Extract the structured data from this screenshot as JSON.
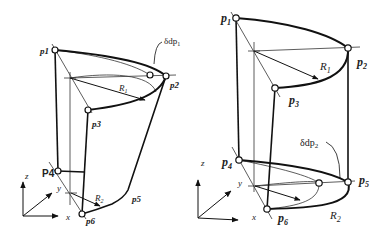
{
  "figures": [
    {
      "id": "left",
      "description": "Tapered (cone-like) sweep between two circular arcs of different radii",
      "points": {
        "p1": "p1",
        "p2": "p2",
        "p3": "p3",
        "p4": "P4",
        "p5": "p5",
        "p6": "p6"
      },
      "radii": {
        "R1": "R",
        "R1_sub": "1",
        "R2": "R",
        "R2_sub": "2"
      },
      "deviation_label": "δdp",
      "deviation_sub": "1",
      "axes": {
        "x": "x",
        "y": "y",
        "z": "z"
      }
    },
    {
      "id": "right",
      "description": "Cylinder-like sweep between two circular arcs",
      "points": {
        "p1": "p",
        "p1_sub": "1",
        "p2": "p",
        "p2_sub": "2",
        "p3": "p",
        "p3_sub": "3",
        "p4": "p",
        "p4_sub": "4",
        "p5": "p",
        "p5_sub": "5",
        "p6": "p",
        "p6_sub": "6"
      },
      "radii": {
        "R1": "R",
        "R1_sub": "1",
        "R2": "R",
        "R2_sub": "2"
      },
      "deviation_label": "δdp",
      "deviation_sub": "2",
      "axes": {
        "x": "x",
        "y": "y",
        "z": "z"
      }
    }
  ],
  "colors": {
    "stroke": "#1a1a1a",
    "thin": "#333333",
    "background": "#ffffff"
  }
}
